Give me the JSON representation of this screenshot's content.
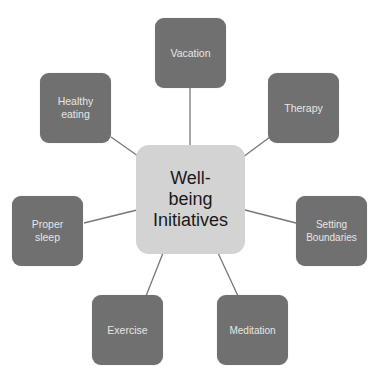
{
  "diagram": {
    "type": "hub-and-spoke",
    "center": {
      "label": "Well-\nbeing\nInitiatives"
    },
    "nodes": [
      {
        "id": "vacation",
        "label": "Vacation"
      },
      {
        "id": "therapy",
        "label": "Therapy"
      },
      {
        "id": "setting-boundaries",
        "label": "Setting\nBoundaries"
      },
      {
        "id": "meditation",
        "label": "Meditation"
      },
      {
        "id": "exercise",
        "label": "Exercise"
      },
      {
        "id": "proper-sleep",
        "label": "Proper\nsleep"
      },
      {
        "id": "healthy-eating",
        "label": "Healthy\neating"
      }
    ],
    "colors": {
      "center_fill": "#d3d3d3",
      "node_fill": "#707070",
      "connector": "#777777",
      "node_text": "#e6e6e6",
      "center_text": "#1a1a1a"
    }
  }
}
